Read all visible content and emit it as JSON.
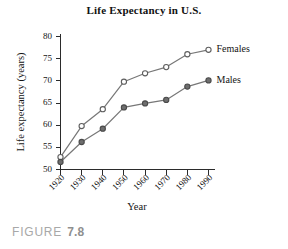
{
  "figure": {
    "caption_label": "FIGURE",
    "caption_number": "7.8"
  },
  "chart_data": {
    "type": "line",
    "title": "Life Expectancy in U.S.",
    "xlabel": "Year",
    "ylabel": "Life expectancy (years)",
    "categories": [
      "1920",
      "1930",
      "1940",
      "1950",
      "1960",
      "1970",
      "1980",
      "1990"
    ],
    "x": [
      1920,
      1930,
      1940,
      1950,
      1960,
      1970,
      1980,
      1990
    ],
    "xlim": [
      1920,
      1990
    ],
    "ylim": [
      50,
      80
    ],
    "yticks": [
      50,
      55,
      60,
      65,
      70,
      75,
      80
    ],
    "xticks": [
      "1920",
      "1930",
      "1940",
      "1950",
      "1960",
      "1970",
      "1980",
      "1990"
    ],
    "grid": false,
    "legend_position": "right-inline",
    "series": [
      {
        "name": "Females",
        "marker": "open-circle",
        "color": "#777777",
        "values": [
          52.8,
          59.8,
          63.6,
          69.8,
          71.7,
          73.1,
          76.0,
          77.0
        ]
      },
      {
        "name": "Males",
        "marker": "filled-circle",
        "color": "#6e6e6e",
        "values": [
          51.7,
          56.2,
          59.2,
          64.0,
          64.9,
          65.7,
          68.7,
          70.1
        ]
      }
    ]
  }
}
